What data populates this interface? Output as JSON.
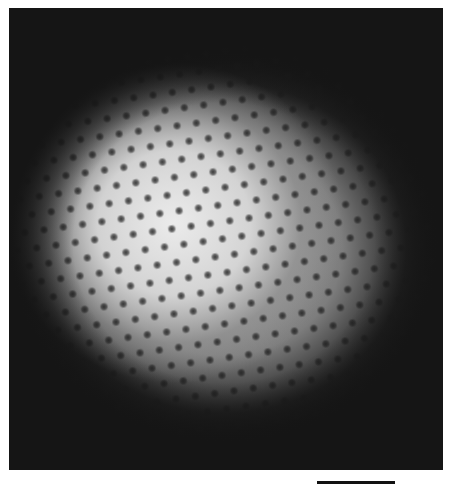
{
  "figure": {
    "type": "micrograph",
    "colors": {
      "background": "#151515",
      "highlight": "#e6e6e6",
      "dots": "#1e1e1e",
      "page": "#ffffff"
    },
    "scale_bar": {
      "label": "",
      "length_px": 78
    }
  }
}
